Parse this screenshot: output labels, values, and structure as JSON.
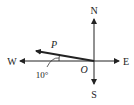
{
  "diagram": {
    "type": "compass-vector",
    "labels": {
      "north": "N",
      "south": "S",
      "west": "W",
      "east": "E",
      "origin": "O",
      "vector": "P",
      "angle": "10°"
    },
    "vector": {
      "name": "P",
      "direction": "10° north of west",
      "angle_deg": 10
    },
    "colors": {
      "ink": "#222222",
      "background": "#ffffff"
    }
  }
}
